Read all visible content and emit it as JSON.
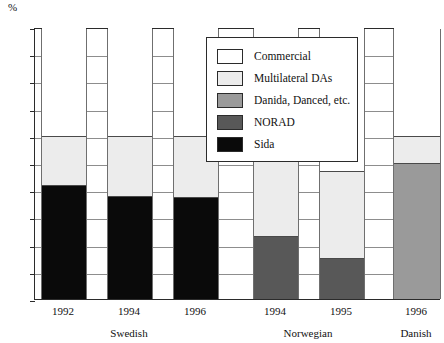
{
  "chart_data": {
    "type": "bar",
    "title": "",
    "subtitle": "",
    "xlabel": "",
    "ylabel": "%",
    "ylim": [
      0,
      100
    ],
    "ytick_step": 10,
    "yticks": [
      "100",
      "90",
      "80",
      "70",
      "60",
      "50",
      "40",
      "30",
      "20",
      "10",
      "0"
    ],
    "grid": "horizontal",
    "stacked": true,
    "legend_position": "inside-top-center",
    "categories": [
      "1992",
      "1994",
      "1996",
      "1994",
      "1995",
      "1996"
    ],
    "groups": [
      {
        "name": "Swedish",
        "categories": [
          "1992",
          "1994",
          "1996"
        ]
      },
      {
        "name": "Norwegian",
        "categories": [
          "1994",
          "1995"
        ]
      },
      {
        "name": "Danish",
        "categories": [
          "1996"
        ]
      }
    ],
    "series": [
      {
        "name": "Sida",
        "color": "#0a0a0a",
        "values": [
          42,
          38,
          37.5,
          0,
          0,
          0
        ]
      },
      {
        "name": "NORAD",
        "color": "#585858",
        "values": [
          0,
          0,
          0,
          23,
          15,
          0
        ]
      },
      {
        "name": "Danida, Danced, etc.",
        "color": "#9a9a9a",
        "values": [
          0,
          0,
          0,
          0,
          0,
          50
        ]
      },
      {
        "name": "Multilateral DAs",
        "color": "#ececec",
        "values": [
          18,
          22,
          22.5,
          37,
          32,
          10
        ]
      },
      {
        "name": "Commercial",
        "color": "#ffffff",
        "values": [
          40,
          40,
          40,
          40,
          53,
          40
        ]
      }
    ],
    "bars": [
      {
        "label": "1992",
        "group": "Swedish",
        "segments": [
          {
            "series": "Sida",
            "from": 0,
            "to": 42
          },
          {
            "series": "Multilateral DAs",
            "from": 42,
            "to": 60
          },
          {
            "series": "Commercial",
            "from": 60,
            "to": 100
          }
        ]
      },
      {
        "label": "1994",
        "group": "Swedish",
        "segments": [
          {
            "series": "Sida",
            "from": 0,
            "to": 38
          },
          {
            "series": "Multilateral DAs",
            "from": 38,
            "to": 60
          },
          {
            "series": "Commercial",
            "from": 60,
            "to": 100
          }
        ]
      },
      {
        "label": "1996",
        "group": "Swedish",
        "segments": [
          {
            "series": "Sida",
            "from": 0,
            "to": 37.5
          },
          {
            "series": "Multilateral DAs",
            "from": 37.5,
            "to": 60
          },
          {
            "series": "Commercial",
            "from": 60,
            "to": 100
          }
        ]
      },
      {
        "label": "1994",
        "group": "Norwegian",
        "segments": [
          {
            "series": "NORAD",
            "from": 0,
            "to": 23
          },
          {
            "series": "Multilateral DAs",
            "from": 23,
            "to": 60
          },
          {
            "series": "Commercial",
            "from": 60,
            "to": 100
          }
        ]
      },
      {
        "label": "1995",
        "group": "Norwegian",
        "segments": [
          {
            "series": "NORAD",
            "from": 0,
            "to": 15
          },
          {
            "series": "Multilateral DAs",
            "from": 15,
            "to": 47
          },
          {
            "series": "Commercial",
            "from": 47,
            "to": 100
          }
        ]
      },
      {
        "label": "1996",
        "group": "Danish",
        "segments": [
          {
            "series": "Danida, Danced, etc.",
            "from": 0,
            "to": 50
          },
          {
            "series": "Multilateral DAs",
            "from": 50,
            "to": 60
          },
          {
            "series": "Commercial",
            "from": 60,
            "to": 100
          }
        ]
      }
    ]
  },
  "axis": {
    "unit": "%",
    "yticks": [
      "100",
      "90",
      "80",
      "70",
      "60",
      "50",
      "40",
      "30",
      "20",
      "10",
      "0"
    ]
  },
  "xaxis": {
    "ticks": [
      "1992",
      "1994",
      "1996",
      "1994",
      "1995",
      "1996"
    ],
    "groups": [
      "Swedish",
      "Norwegian",
      "Danish"
    ]
  },
  "legend": {
    "items": [
      {
        "label": "Commercial",
        "swatch": "commercial"
      },
      {
        "label": "Multilateral DAs",
        "swatch": "multi"
      },
      {
        "label": "Danida, Danced, etc.",
        "swatch": "danida"
      },
      {
        "label": "NORAD",
        "swatch": "norad"
      },
      {
        "label": "Sida",
        "swatch": "sida"
      }
    ]
  }
}
